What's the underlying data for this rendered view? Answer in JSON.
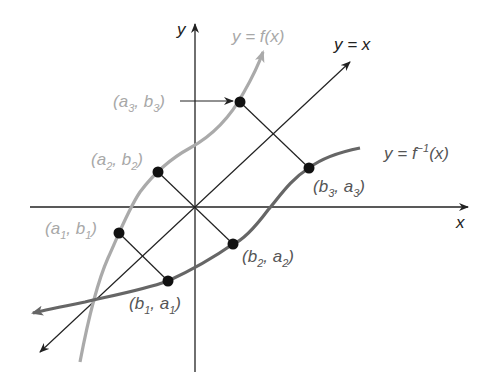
{
  "diagram": {
    "axes": {
      "x_label": "x",
      "y_label": "y"
    },
    "curves": [
      {
        "name": "f",
        "label": "y = f(x)",
        "color": "#aaaaaa"
      },
      {
        "name": "f_inverse",
        "label": "y = f⁻¹(x)",
        "color": "#666666"
      },
      {
        "name": "identity",
        "label": "y = x",
        "color": "#222222"
      }
    ],
    "points_on_f": [
      {
        "label": "(a₁, b₁)",
        "base": [
          "a",
          "b"
        ],
        "index": "1"
      },
      {
        "label": "(a₂, b₂)",
        "base": [
          "a",
          "b"
        ],
        "index": "2"
      },
      {
        "label": "(a₃, b₃)",
        "base": [
          "a",
          "b"
        ],
        "index": "3"
      }
    ],
    "points_on_f_inverse": [
      {
        "label": "(b₁, a₁)",
        "base": [
          "b",
          "a"
        ],
        "index": "1"
      },
      {
        "label": "(b₂, a₂)",
        "base": [
          "b",
          "a"
        ],
        "index": "2"
      },
      {
        "label": "(b₃, a₃)",
        "base": [
          "b",
          "a"
        ],
        "index": "3"
      }
    ],
    "text": {
      "y_eq": "y = ",
      "f_of_x": "f(x)",
      "y_eq_x": "y = x",
      "f_inv": "f",
      "inv_exp": "−1",
      "paren_x": "(x)",
      "open": "(",
      "comma": ", ",
      "close": ")"
    }
  }
}
